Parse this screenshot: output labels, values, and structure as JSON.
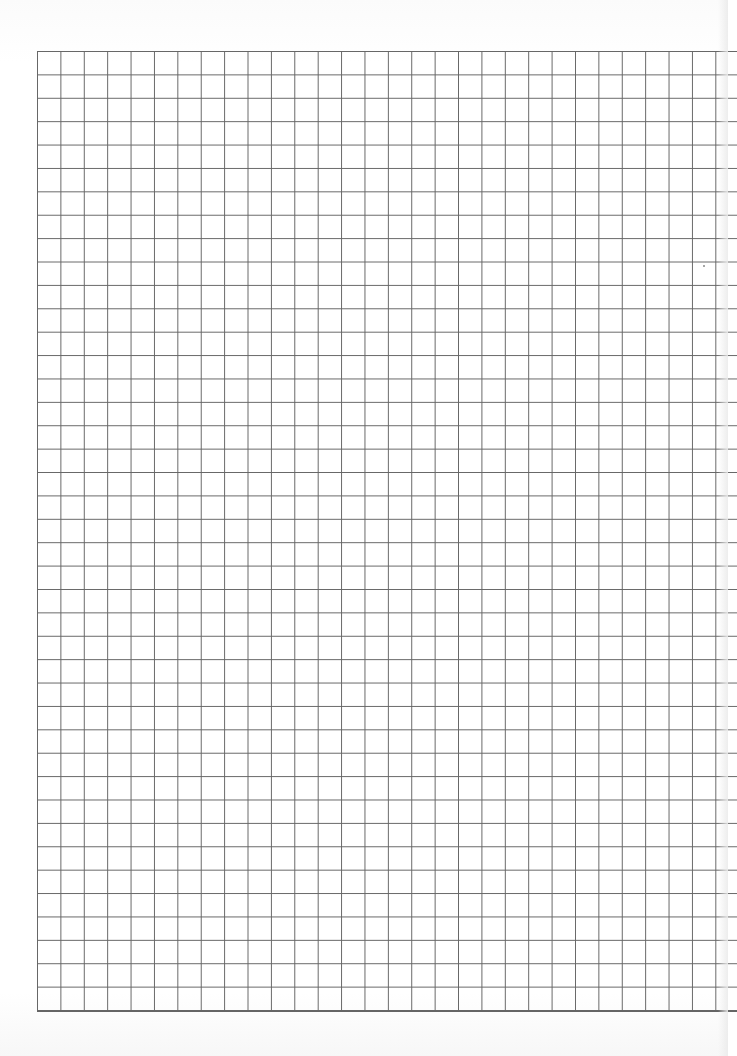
{
  "page": {
    "type": "grid-paper",
    "grid": {
      "columns": 29,
      "rows": 41,
      "cell_size_px": 23.4,
      "line_color": "#555555",
      "background_color": "#ffffff"
    }
  }
}
